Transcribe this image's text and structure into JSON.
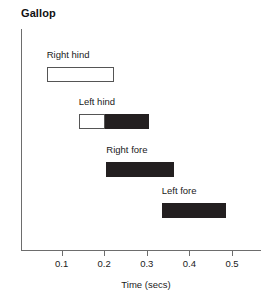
{
  "chart_data": {
    "type": "bar",
    "orientation": "horizontal",
    "title": "Gallop",
    "xlabel": "Time (secs)",
    "ylabel": "",
    "xlim": [
      0.0,
      0.56
    ],
    "xticks": [
      0.1,
      0.2,
      0.3,
      0.4,
      0.5
    ],
    "xticklabels": [
      "0.1",
      "0.2",
      "0.3",
      "0.4",
      "0.5"
    ],
    "grid": false,
    "legend": null,
    "categories": [
      "Right hind",
      "Left hind",
      "Right fore",
      "Left fore"
    ],
    "bars": [
      {
        "label": "Right hind",
        "start": 0.065,
        "end": 0.223,
        "duration": 0.158,
        "segments": [
          {
            "start": 0.065,
            "end": 0.223,
            "fill": "open"
          }
        ]
      },
      {
        "label": "Left hind",
        "start": 0.14,
        "end": 0.305,
        "duration": 0.165,
        "segments": [
          {
            "start": 0.14,
            "end": 0.202,
            "fill": "open"
          },
          {
            "start": 0.202,
            "end": 0.305,
            "fill": "filled"
          }
        ]
      },
      {
        "label": "Right fore",
        "start": 0.205,
        "end": 0.363,
        "duration": 0.158,
        "segments": [
          {
            "start": 0.205,
            "end": 0.363,
            "fill": "filled"
          }
        ]
      },
      {
        "label": "Left fore",
        "start": 0.335,
        "end": 0.487,
        "duration": 0.152,
        "segments": [
          {
            "start": 0.335,
            "end": 0.487,
            "fill": "filled"
          }
        ]
      }
    ],
    "colors": {
      "filled": "#231f20",
      "open": "#ffffff",
      "outline": "#555555",
      "axis": "#6d6d6d",
      "text": "#1a1a1a"
    }
  }
}
